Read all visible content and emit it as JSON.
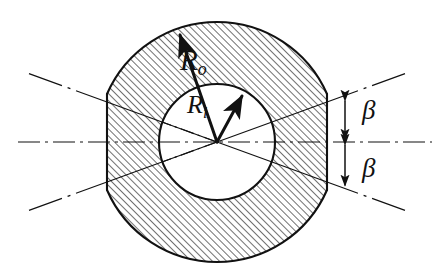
{
  "figure": {
    "kind": "engineering-cross-section-diagram",
    "background_color": "#ffffff",
    "line_color": "#111111",
    "hatch_color": "#2b2b2b"
  },
  "labels": {
    "outer_radius": {
      "base": "R",
      "sub": "o",
      "full": "Ro"
    },
    "inner_radius": {
      "base": "R",
      "sub": "i",
      "full": "Ri"
    },
    "beta_top": "β",
    "beta_bottom": "β"
  },
  "geometry": {
    "center": {
      "x": 217,
      "y": 142
    },
    "outer_radius": 120,
    "inner_radius": 58,
    "left_chord_x": 107,
    "right_chord_x": 327,
    "beta_angle_deg": 20,
    "dimension_line_x": 345,
    "beta_top_span": {
      "from_y": 100,
      "to_y": 141
    },
    "beta_bottom_span": {
      "from_y": 143,
      "to_y": 186
    },
    "hatch_angle_deg": 45,
    "hatch_spacing_px": 5
  },
  "arrows": {
    "outer_radius_arrow": {
      "from": {
        "x": 217,
        "y": 142
      },
      "to": {
        "x": 178,
        "y": 31
      },
      "label": "Ro"
    },
    "inner_radius_arrow": {
      "from": {
        "x": 217,
        "y": 142
      },
      "to": {
        "x": 243,
        "y": 93
      },
      "label": "Ri"
    }
  },
  "centerlines": {
    "style": "dash-dot",
    "horizontal": {
      "from_x": 18,
      "to_x": 432,
      "y": 142
    },
    "radials_deg": [
      20,
      -20,
      160,
      200
    ]
  }
}
